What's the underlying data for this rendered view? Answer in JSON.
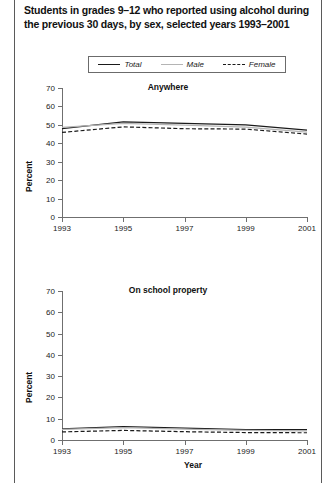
{
  "figure": {
    "title": "Students in grades 9–12 who reported using alcohol during the previous 30 days, by sex, selected years 1993–2001"
  },
  "legend": {
    "items": [
      {
        "label": "Total",
        "style": "solid",
        "color": "#1a1a1a",
        "icon": "line-solid-dark-icon"
      },
      {
        "label": "Male",
        "style": "solid",
        "color": "#b4b4b4",
        "icon": "line-solid-gray-icon"
      },
      {
        "label": "Female",
        "style": "dashed",
        "color": "#1a1a1a",
        "icon": "line-dashed-icon"
      }
    ]
  },
  "panels": [
    {
      "subtitle": "Anywhere",
      "ylabel": "Percent",
      "xlabel": ""
    },
    {
      "subtitle": "On school property",
      "ylabel": "Percent",
      "xlabel": "Year"
    }
  ],
  "axis": {
    "y_ticks": [
      "0",
      "10",
      "20",
      "30",
      "40",
      "50",
      "60",
      "70"
    ],
    "x_ticks": [
      "1993",
      "1995",
      "1997",
      "1999",
      "2001"
    ]
  },
  "chart_data": [
    {
      "type": "line",
      "title": "Anywhere",
      "subtitle": "Students in grades 9–12 who reported using alcohol during the previous 30 days, by sex, selected years 1993–2001",
      "xlabel": "",
      "ylabel": "Percent",
      "x": [
        1993,
        1995,
        1997,
        1999,
        2001
      ],
      "xlim": [
        1993,
        2001
      ],
      "ylim": [
        0,
        70
      ],
      "yticks": [
        0,
        10,
        20,
        30,
        40,
        50,
        60,
        70
      ],
      "xticks": [
        1993,
        1995,
        1997,
        1999,
        2001
      ],
      "grid": false,
      "legend_position": "above-plot",
      "series": [
        {
          "name": "Total",
          "style": "solid",
          "color": "#1a1a1a",
          "values": [
            48.0,
            51.6,
            50.8,
            50.0,
            47.1
          ]
        },
        {
          "name": "Male",
          "style": "solid",
          "color": "#b4b4b4",
          "values": [
            48.6,
            50.8,
            49.9,
            48.8,
            46.1
          ]
        },
        {
          "name": "Female",
          "style": "dashed",
          "color": "#1a1a1a",
          "values": [
            45.9,
            48.9,
            47.9,
            47.7,
            45.0
          ]
        }
      ]
    },
    {
      "type": "line",
      "title": "On school property",
      "xlabel": "Year",
      "ylabel": "Percent",
      "x": [
        1993,
        1995,
        1997,
        1999,
        2001
      ],
      "xlim": [
        1993,
        2001
      ],
      "ylim": [
        0,
        70
      ],
      "yticks": [
        0,
        10,
        20,
        30,
        40,
        50,
        60,
        70
      ],
      "xticks": [
        1993,
        1995,
        1997,
        1999,
        2001
      ],
      "grid": false,
      "legend_position": "above-plot",
      "series": [
        {
          "name": "Total",
          "style": "solid",
          "color": "#1a1a1a",
          "values": [
            5.2,
            6.3,
            5.6,
            4.9,
            4.9
          ]
        },
        {
          "name": "Male",
          "style": "solid",
          "color": "#b4b4b4",
          "values": [
            5.0,
            5.8,
            5.1,
            4.5,
            4.3
          ]
        },
        {
          "name": "Female",
          "style": "dashed",
          "color": "#1a1a1a",
          "values": [
            3.8,
            4.5,
            3.9,
            3.5,
            3.4
          ]
        }
      ]
    }
  ]
}
